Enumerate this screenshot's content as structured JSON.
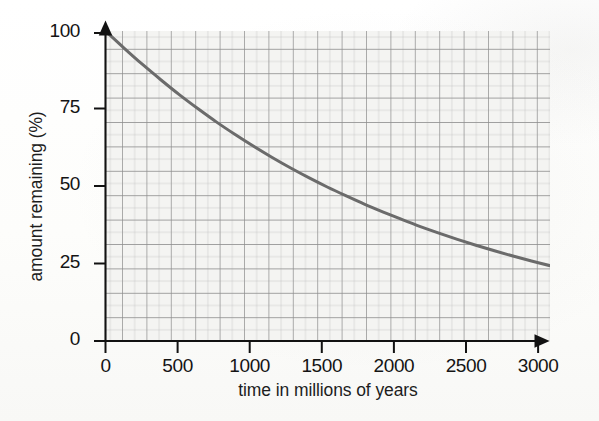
{
  "chart_data": {
    "type": "line",
    "title": "",
    "subtitle": "",
    "xlabel": "time in millions of years",
    "ylabel": "amount remaining (%)",
    "xlim": [
      0,
      3000
    ],
    "ylim": [
      0,
      100
    ],
    "xticks": [
      0,
      500,
      1000,
      1500,
      2000,
      2500,
      3000
    ],
    "xtick_labels": [
      "0",
      "500",
      "1000",
      "1500",
      "2000",
      "2500",
      "3000"
    ],
    "yticks": [
      0,
      25,
      50,
      75,
      100
    ],
    "ytick_labels": [
      "0",
      "25",
      "50",
      "75",
      "100"
    ],
    "grid": true,
    "grid_style": "graph-paper, minor cells every 62.5 years (x) and 3.2% (y), bold major line every 2 minor cells",
    "legend": false,
    "legend_position": "none",
    "axis_arrows": true,
    "series": [
      {
        "name": "amount remaining",
        "color": "#6b6b6b",
        "line_width": 3,
        "x": [
          0,
          125,
          250,
          375,
          500,
          625,
          750,
          875,
          1000,
          1125,
          1250,
          1375,
          1500,
          1625,
          1750,
          1875,
          2000,
          2125,
          2250,
          2375,
          2500,
          2625,
          2750,
          2875,
          3000
        ],
        "y": [
          100,
          94.5,
          89.2,
          84.2,
          79.4,
          74.9,
          70.6,
          66.6,
          62.8,
          59.2,
          55.8,
          52.6,
          49.6,
          46.8,
          44.1,
          41.6,
          39.2,
          36.9,
          34.8,
          32.8,
          30.9,
          29.1,
          27.4,
          25.8,
          24.3
        ]
      }
    ],
    "annotations": []
  },
  "axes": {
    "y_label": "amount remaining (%)",
    "x_label": "time in millions of years"
  }
}
